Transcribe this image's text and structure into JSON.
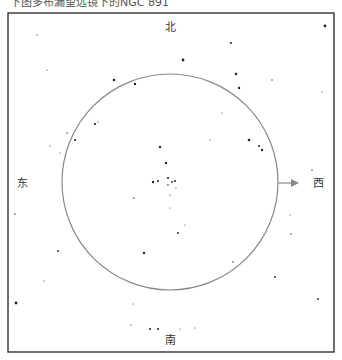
{
  "caption": "下图多布漏望远镜下的NGC 891",
  "directions": {
    "north": "北",
    "south": "南",
    "east": "东",
    "west": "西"
  },
  "colors": {
    "frame": "#333333",
    "circle": "#888888",
    "arrow": "#888888",
    "star": "#222222",
    "text": "#333333"
  },
  "field_of_view": {
    "label": "eyepiece-field",
    "drift_direction": "west"
  }
}
